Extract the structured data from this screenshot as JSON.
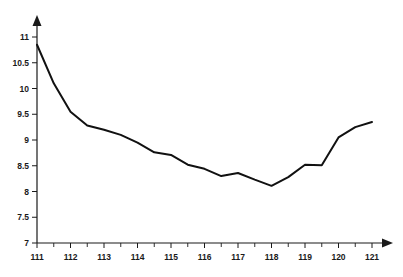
{
  "chart_data": {
    "type": "line",
    "title": "",
    "subtitle": "",
    "xlabel": "",
    "ylabel": "",
    "xlim": [
      111,
      121
    ],
    "ylim": [
      7,
      11
    ],
    "grid": false,
    "legend": null,
    "legend_position": "none",
    "line_color": "#111111",
    "axis_color": "#1a1a1a",
    "background_color": "#ffffff",
    "x_tick_labels": [
      "111",
      "112",
      "113",
      "114",
      "115",
      "116",
      "117",
      "118",
      "119",
      "120",
      "121"
    ],
    "x_ticks": [
      111,
      112,
      113,
      114,
      115,
      116,
      117,
      118,
      119,
      120,
      121
    ],
    "x_minor_ticks": [
      111.5,
      112.5,
      113.5,
      114.5,
      115.5,
      116.5,
      117.5,
      118.5,
      119.5,
      120.5
    ],
    "y_tick_labels": [
      "7",
      "7.5",
      "8",
      "8.5",
      "9",
      "9.5",
      "10",
      "10.5",
      "11"
    ],
    "y_ticks": [
      7,
      7.5,
      8,
      8.5,
      9,
      9.5,
      10,
      10.5,
      11
    ],
    "x": [
      111,
      111.5,
      112,
      112.5,
      113,
      113.5,
      114,
      114.5,
      115,
      115.5,
      116,
      116.5,
      117,
      117.5,
      118,
      118.5,
      119,
      119.5,
      120,
      120.5,
      121
    ],
    "values": [
      10.85,
      10.1,
      9.55,
      9.28,
      9.2,
      9.1,
      8.95,
      8.76,
      8.71,
      8.52,
      8.44,
      8.3,
      8.36,
      8.23,
      8.11,
      8.28,
      8.52,
      8.51,
      9.05,
      9.25,
      9.35
    ],
    "series": [
      {
        "name": "series-1",
        "color": "#111111",
        "values": [
          10.85,
          10.1,
          9.55,
          9.28,
          9.2,
          9.1,
          8.95,
          8.76,
          8.71,
          8.52,
          8.44,
          8.3,
          8.36,
          8.23,
          8.11,
          8.28,
          8.52,
          8.51,
          9.05,
          9.25,
          9.35
        ]
      }
    ],
    "annotations": []
  }
}
